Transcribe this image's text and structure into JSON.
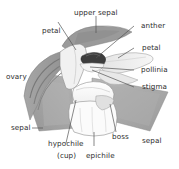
{
  "figure": {
    "background_color": "#ffffff",
    "label_color": "#2b2b2b",
    "leader_line_color": "#555555",
    "outline_color": "#4a4a4a"
  },
  "labels": {
    "upper_sepal": "upper sepal",
    "petal_left": "petal",
    "anther": "anther",
    "petal_right": "petal",
    "pollinia": "pollinia",
    "stigma": "stigma",
    "ovary": "ovary",
    "sepal_left": "sepal",
    "sepal_right": "sepal",
    "hypochile": "hypochile",
    "hypochile_sub": "(cup)",
    "epichile": "epichile",
    "boss": "boss"
  },
  "palette": {
    "sepal_gray": "#a9a9a9",
    "sepal_gray_light": "#bdbdbd",
    "petal_pale": "#ededed",
    "petal_white": "#f7f7f7",
    "lip_white": "#fcfcfc",
    "anther_dark": "#3a3a3a",
    "ovary_gray": "#9d9d9d",
    "shadow_gray": "#8e8e8e"
  }
}
